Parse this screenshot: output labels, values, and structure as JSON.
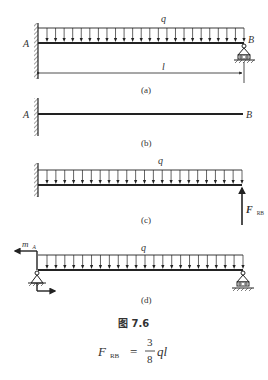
{
  "figure": {
    "title": "图 7.6",
    "panels": [
      {
        "id": "a",
        "caption": "(a)",
        "labels": {
          "left": "A",
          "right": "B",
          "load": "q",
          "length": "l"
        }
      },
      {
        "id": "b",
        "caption": "(b)",
        "labels": {
          "left": "A",
          "right": "B"
        }
      },
      {
        "id": "c",
        "caption": "(c)",
        "labels": {
          "load": "q",
          "reaction": "F",
          "reaction_sub": "RB"
        }
      },
      {
        "id": "d",
        "caption": "(d)",
        "labels": {
          "load": "q",
          "moment": "m",
          "moment_sub": "A"
        }
      }
    ],
    "formula": {
      "lhs": "F",
      "lhs_sub": "RB",
      "equals": "=",
      "numerator": "3",
      "denominator": "8",
      "rhs": "ql"
    }
  },
  "colors": {
    "line": "#222222",
    "text": "#333333",
    "background": "#ffffff"
  }
}
